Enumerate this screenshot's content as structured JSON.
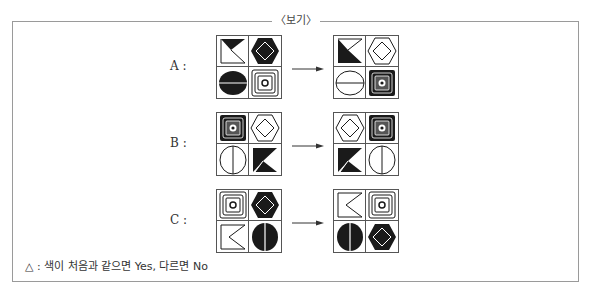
{
  "frame": {
    "title": "〈보기〉"
  },
  "rows": [
    {
      "label": "A :",
      "before": [
        "flag-black-top",
        "hexagon-black",
        "circle-black",
        "square-concentric-white"
      ],
      "after": [
        "flag-black-bottom",
        "hexagon-white",
        "circle-white",
        "square-concentric-black"
      ]
    },
    {
      "label": "B :",
      "before": [
        "square-concentric-black",
        "hexagon-white",
        "circle-white-vertical",
        "flag-black-k"
      ],
      "after": [
        "hexagon-white",
        "square-concentric-black",
        "flag-black-k",
        "circle-white-vertical"
      ]
    },
    {
      "label": "C :",
      "before": [
        "square-concentric-white",
        "hexagon-black",
        "flag-white-z",
        "circle-black-vertical"
      ],
      "after": [
        "flag-white-z",
        "square-concentric-white",
        "circle-black-vertical",
        "hexagon-black"
      ]
    }
  ],
  "note": {
    "symbol": "△",
    "text": " : 색이 처음과 같으면 Yes, 다르면 No"
  },
  "colors": {
    "ink": "#1a1a1a",
    "line": "#555555",
    "frame": "#9a9a9a"
  }
}
